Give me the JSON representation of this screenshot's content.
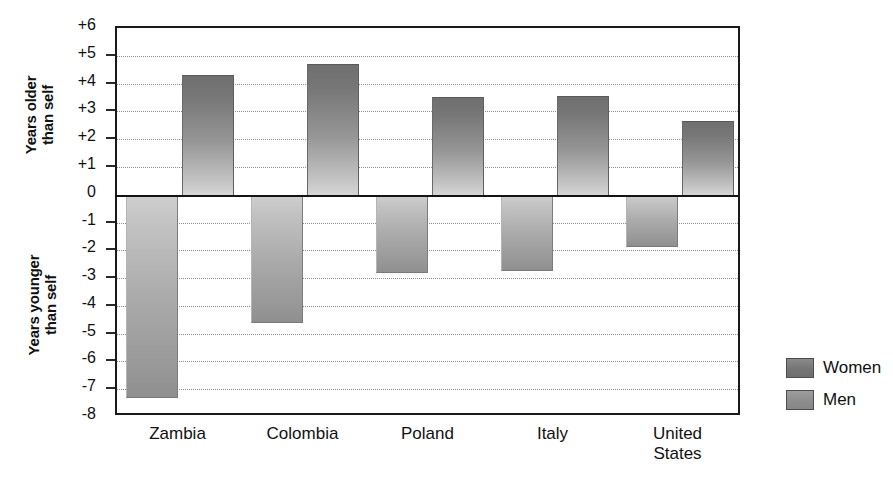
{
  "chart_data": {
    "type": "bar",
    "title": "",
    "xlabel": "",
    "ylabel": "Years older than self / Years younger than self",
    "ylim": [
      -8,
      6
    ],
    "grid": true,
    "legend_position": "right",
    "categories": [
      "Zambia",
      "Colombia",
      "Poland",
      "Italy",
      "United\nStates"
    ],
    "series": [
      {
        "name": "Women",
        "values": [
          -7.3,
          -4.6,
          -2.8,
          -2.75,
          -1.9
        ]
      },
      {
        "name": "Men",
        "values": [
          4.3,
          4.7,
          3.5,
          3.55,
          2.65
        ]
      }
    ],
    "ytick_labels": [
      "+6",
      "+5",
      "+4",
      "+3",
      "+2",
      "+1",
      "0",
      "-1",
      "-2",
      "-3",
      "-4",
      "-5",
      "-6",
      "-7",
      "-8"
    ],
    "ytick_values": [
      6,
      5,
      4,
      3,
      2,
      1,
      0,
      -1,
      -2,
      -3,
      -4,
      -5,
      -6,
      -7,
      -8
    ],
    "axis_group_labels": {
      "upper": "Years older\nthan self",
      "lower": "Years younger\nthan self"
    },
    "colors": {
      "women_swatch": "#777777",
      "men_swatch": "#8f8f8f",
      "axis": "#1a1a1a",
      "gridline": "#8d8d8d",
      "background": "#ffffff"
    }
  }
}
